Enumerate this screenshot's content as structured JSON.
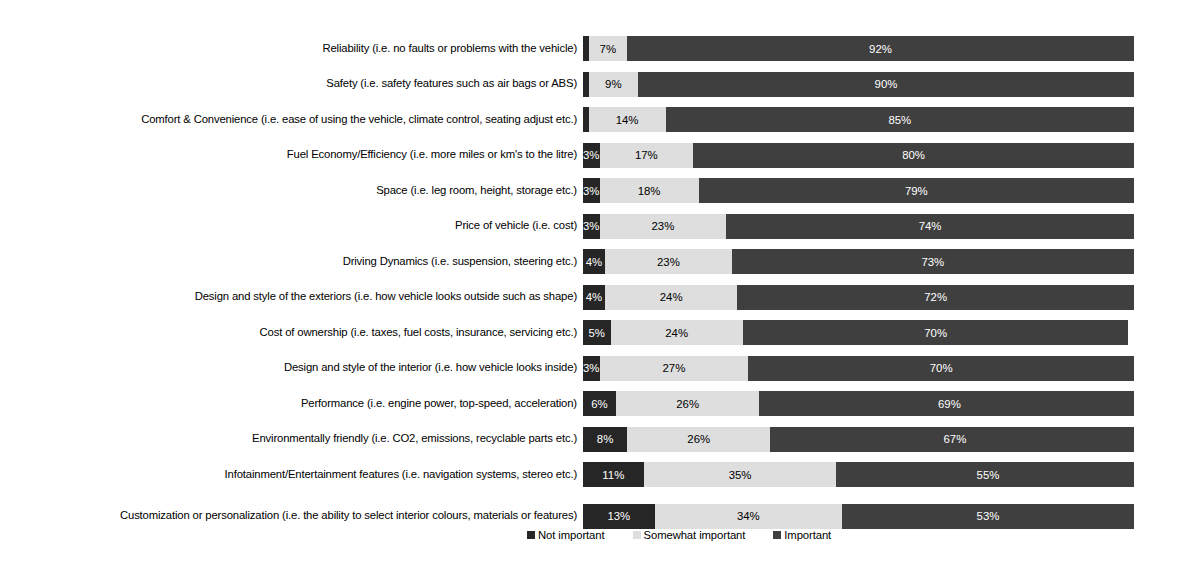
{
  "chart_data": {
    "type": "bar",
    "subtype": "stacked-horizontal-100pct",
    "title": "",
    "subtitle": "",
    "xlabel": "",
    "ylabel": "",
    "xlim": [
      0,
      100
    ],
    "grid": false,
    "legend_position": "bottom",
    "categories": [
      "Reliability (i.e. no faults or problems with the vehicle)",
      "Safety (i.e. safety features such as air bags or ABS)",
      "Comfort & Convenience (i.e. ease of using the vehicle, climate control, seating adjust etc.)",
      "Fuel Economy/Efficiency (i.e. more miles or km's to the litre)",
      "Space (i.e. leg room, height, storage etc.)",
      "Price of vehicle (i.e. cost)",
      "Driving Dynamics (i.e. suspension, steering etc.)",
      "Design and style of the exteriors (i.e. how vehicle looks outside such as shape)",
      "Cost of ownership (i.e. taxes, fuel costs, insurance, servicing etc.)",
      "Design and style of the interior (i.e. how vehicle looks inside)",
      "Performance (i.e. engine power, top-speed, acceleration)",
      "Environmentally friendly (i.e. CO2, emissions, recyclable parts etc.)",
      "Infotainment/Entertainment features (i.e. navigation systems, stereo etc.)",
      "Customization or personalization (i.e. the ability to select interior colours, materials or features)"
    ],
    "series": [
      {
        "name": "Not important",
        "color": "#262626",
        "values": [
          1,
          1,
          1,
          3,
          3,
          3,
          4,
          4,
          5,
          3,
          6,
          8,
          11,
          13
        ],
        "labels": [
          "",
          "",
          "",
          "3%",
          "3%",
          "3%",
          "4%",
          "4%",
          "5%",
          "3%",
          "6%",
          "8%",
          "11%",
          "13%"
        ]
      },
      {
        "name": "Somewhat important",
        "color": "#dedede",
        "values": [
          7,
          9,
          14,
          17,
          18,
          23,
          23,
          24,
          24,
          27,
          26,
          26,
          35,
          34
        ],
        "labels": [
          "7%",
          "9%",
          "14%",
          "17%",
          "18%",
          "23%",
          "23%",
          "24%",
          "24%",
          "27%",
          "26%",
          "26%",
          "35%",
          "34%"
        ]
      },
      {
        "name": "Important",
        "color": "#3f3f3f",
        "values": [
          92,
          90,
          85,
          80,
          79,
          74,
          73,
          72,
          70,
          70,
          69,
          67,
          55,
          53
        ],
        "labels": [
          "92%",
          "90%",
          "85%",
          "80%",
          "79%",
          "74%",
          "73%",
          "72%",
          "70%",
          "70%",
          "69%",
          "67%",
          "55%",
          "53%"
        ]
      }
    ]
  },
  "legend": {
    "items": [
      {
        "label": "Not important",
        "color": "#262626"
      },
      {
        "label": "Somewhat important",
        "color": "#dedede"
      },
      {
        "label": "Important",
        "color": "#3f3f3f"
      }
    ]
  }
}
